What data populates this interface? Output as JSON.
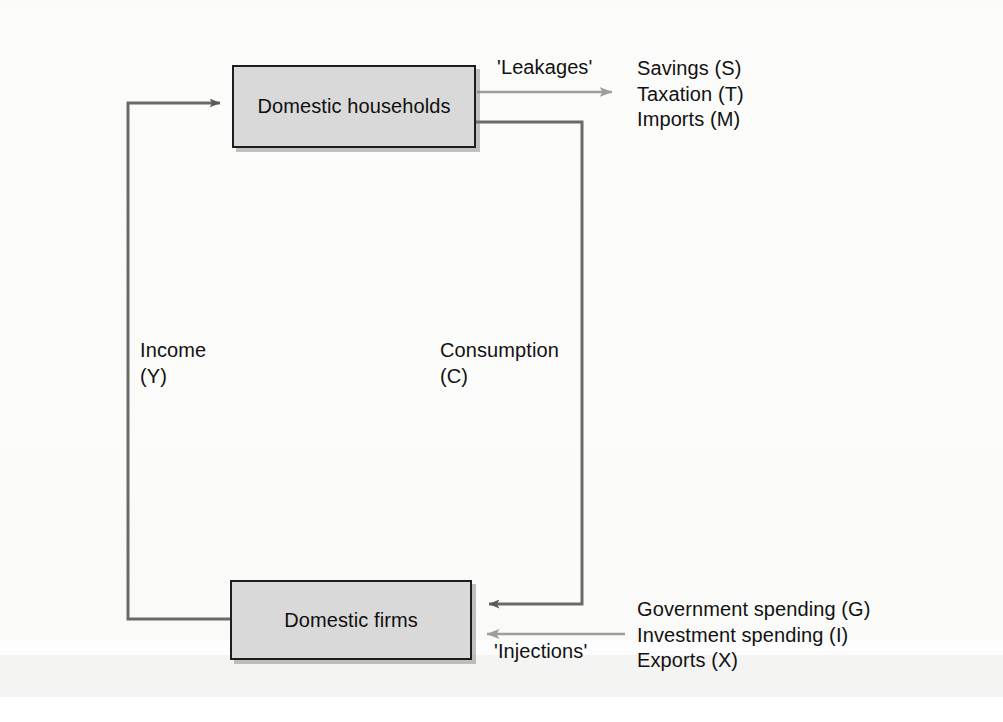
{
  "diagram": {
    "type": "circular-flow",
    "nodes": [
      {
        "id": "households",
        "label": "Domestic households"
      },
      {
        "id": "firms",
        "label": "Domestic firms"
      }
    ],
    "flows": {
      "income": {
        "line1": "Income",
        "line2": "(Y)"
      },
      "consumption": {
        "line1": "Consumption",
        "line2": "(C)"
      }
    },
    "leakages": {
      "heading": "'Leakages'",
      "items": [
        "Savings (S)",
        "Taxation (T)",
        "Imports (M)"
      ]
    },
    "injections": {
      "heading": "'Injections'",
      "items": [
        "Government spending (G)",
        "Investment spending (I)",
        "Exports (X)"
      ]
    },
    "colors": {
      "box_fill": "#d9d9d9",
      "box_border": "#1d1d1d",
      "strong_line": "#5a5a5a",
      "light_line": "#9d9d9d",
      "text": "#121212",
      "background": "#fdfdfd"
    }
  }
}
